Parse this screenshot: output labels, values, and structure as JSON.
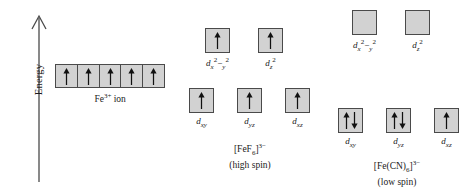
{
  "axis": {
    "label": "Energy",
    "icon": "up-arrow-icon"
  },
  "free_ion": {
    "caption_prefix": "Fe",
    "caption_charge": "3+",
    "caption_suffix": " ion",
    "orbitals": [
      {
        "electrons": "up"
      },
      {
        "electrons": "up"
      },
      {
        "electrons": "up"
      },
      {
        "electrons": "up"
      },
      {
        "electrons": "up"
      }
    ]
  },
  "complexes": [
    {
      "id": "high-spin",
      "formula_prefix": "[FeF",
      "formula_sub": "6",
      "formula_close": "]",
      "formula_charge": "3−",
      "spin_state": "(high spin)",
      "eg": [
        {
          "label_base": "d",
          "label_sub": "x",
          "label_sup1": "2",
          "label_sub2": "y",
          "label_sup2": "2",
          "name": "d-x2-y2",
          "electrons": "up"
        },
        {
          "label_base": "d",
          "label_sub": "z",
          "label_sup1": "2",
          "name": "d-z2",
          "electrons": "up"
        }
      ],
      "t2g": [
        {
          "label_base": "d",
          "label_sub": "xy",
          "name": "d-xy",
          "electrons": "up"
        },
        {
          "label_base": "d",
          "label_sub": "yz",
          "name": "d-yz",
          "electrons": "up"
        },
        {
          "label_base": "d",
          "label_sub": "xz",
          "name": "d-xz",
          "electrons": "up"
        }
      ]
    },
    {
      "id": "low-spin",
      "formula_prefix": "[Fe(CN)",
      "formula_sub": "6",
      "formula_close": "]",
      "formula_charge": "3−",
      "spin_state": "(low spin)",
      "eg": [
        {
          "label_base": "d",
          "label_sub": "x",
          "label_sup1": "2",
          "label_sub2": "y",
          "label_sup2": "2",
          "name": "d-x2-y2",
          "electrons": "empty"
        },
        {
          "label_base": "d",
          "label_sub": "z",
          "label_sup1": "2",
          "name": "d-z2",
          "electrons": "empty"
        }
      ],
      "t2g": [
        {
          "label_base": "d",
          "label_sub": "xy",
          "name": "d-xy",
          "electrons": "pair"
        },
        {
          "label_base": "d",
          "label_sub": "yz",
          "name": "d-yz",
          "electrons": "pair"
        },
        {
          "label_base": "d",
          "label_sub": "xz",
          "name": "d-xz",
          "electrons": "up"
        }
      ]
    }
  ],
  "colors": {
    "box_fill": "#d2d2d2",
    "box_border": "#4a4a4a",
    "text": "#1a1a1a",
    "arrow": "#111111"
  }
}
